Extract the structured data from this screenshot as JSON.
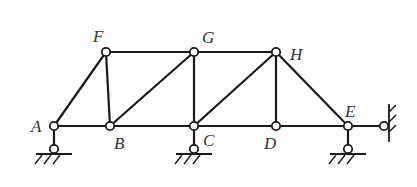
{
  "diagram": {
    "type": "truss",
    "nodes": [
      {
        "id": "A",
        "label": "A",
        "x": 54,
        "y": 126,
        "lx": 31,
        "ly": 132
      },
      {
        "id": "B",
        "label": "B",
        "x": 110,
        "y": 126,
        "lx": 114,
        "ly": 149
      },
      {
        "id": "C",
        "label": "C",
        "x": 194,
        "y": 126,
        "lx": 203,
        "ly": 146
      },
      {
        "id": "D",
        "label": "D",
        "x": 276,
        "y": 126,
        "lx": 264,
        "ly": 149
      },
      {
        "id": "E",
        "label": "E",
        "x": 348,
        "y": 126,
        "lx": 345,
        "ly": 117
      },
      {
        "id": "F",
        "label": "F",
        "x": 106,
        "y": 52,
        "lx": 93,
        "ly": 42
      },
      {
        "id": "G",
        "label": "G",
        "x": 194,
        "y": 52,
        "lx": 202,
        "ly": 43
      },
      {
        "id": "H",
        "label": "H",
        "x": 276,
        "y": 52,
        "lx": 290,
        "ly": 60
      }
    ],
    "members": [
      [
        "A",
        "B"
      ],
      [
        "B",
        "C"
      ],
      [
        "C",
        "D"
      ],
      [
        "D",
        "E"
      ],
      [
        "F",
        "G"
      ],
      [
        "G",
        "H"
      ],
      [
        "A",
        "F"
      ],
      [
        "F",
        "B"
      ],
      [
        "B",
        "G"
      ],
      [
        "G",
        "C"
      ],
      [
        "C",
        "H"
      ],
      [
        "H",
        "D"
      ],
      [
        "H",
        "E"
      ]
    ],
    "supports": [
      {
        "node": "A",
        "type": "vertical-link",
        "pin_x": 54,
        "pin_y": 149
      },
      {
        "node": "C",
        "type": "vertical-link",
        "pin_x": 194,
        "pin_y": 149
      },
      {
        "node": "E",
        "type": "vertical-link",
        "pin_x": 348,
        "pin_y": 149
      },
      {
        "node": "E",
        "type": "horizontal-link",
        "pin_x": 384,
        "pin_y": 126
      }
    ],
    "colors": {
      "line": "#1a1a1a",
      "label": "#333333",
      "background": "#ffffff"
    }
  }
}
